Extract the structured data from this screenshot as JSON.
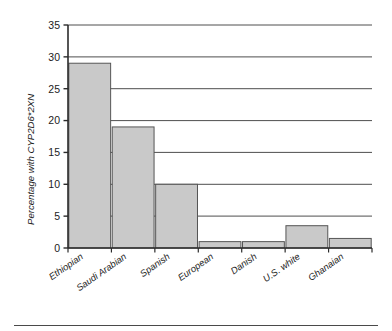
{
  "chart_data": {
    "type": "bar",
    "title": "",
    "subtitle": "",
    "xlabel": "",
    "ylabel": "Percentage with CYP2D6*2XN",
    "categories": [
      "Ethiopian",
      "Saudi Arabian",
      "Spanish",
      "European",
      "Danish",
      "U.S. white",
      "Ghanaian"
    ],
    "values": [
      29,
      19,
      10,
      1,
      1,
      3.5,
      1.5
    ],
    "ylim": [
      0,
      35
    ],
    "ytick_labels": [
      "0",
      "5",
      "10",
      "15",
      "20",
      "25",
      "30",
      "35"
    ],
    "ytick_values": [
      0,
      5,
      10,
      15,
      20,
      25,
      30,
      35
    ],
    "grid": true,
    "grid_axis": "y",
    "legend": false,
    "legend_position": "none",
    "bar_fill_color": "#c9c9c9",
    "bar_edge_color": "#555555",
    "axis_color": "#2b2b2b",
    "grid_color": "#3a3a3a",
    "annotations": []
  },
  "figure": {
    "footer_rule": true
  }
}
